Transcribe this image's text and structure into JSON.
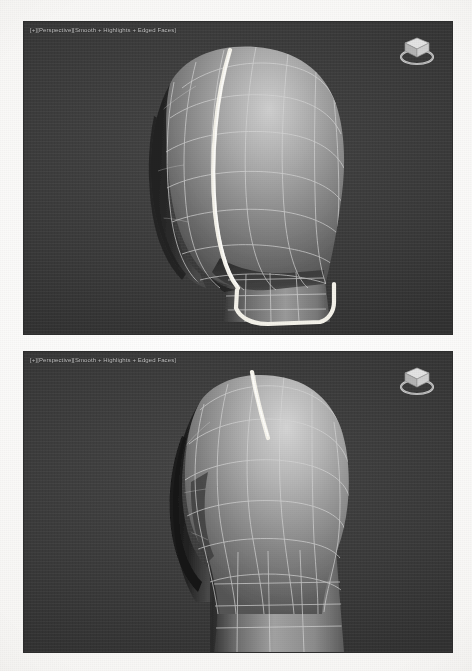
{
  "page": {
    "background_color": "#fdfdfc"
  },
  "viewports": [
    {
      "id": "viewport-top",
      "label": "[+][Perspective][Smooth + Highlights + Edged Faces]",
      "label_parts": {
        "menu": "[+]",
        "view": "[Perspective]",
        "shading": "[Smooth + Highlights + Edged Faces]"
      },
      "background_color": "#3d3d3d",
      "model": {
        "name": "head-mesh",
        "view_angle": "three-quarter front-left",
        "shading": "smooth-highlights",
        "wireframe_visible": true,
        "wireframe_color": "#d9d9d9",
        "selection": {
          "type": "edge-loop",
          "color": "#f2f0e8",
          "description": "Vertical edge loop down the side of the face and a loop around the jaw and chin"
        }
      },
      "viewcube": {
        "name": "view-cube",
        "face_label": "TOP",
        "compass_ring": true
      }
    },
    {
      "id": "viewport-bottom",
      "label": "[+][Perspective][Smooth + Highlights + Edged Faces]",
      "label_parts": {
        "menu": "[+]",
        "view": "[Perspective]",
        "shading": "[Smooth + Highlights + Edged Faces]"
      },
      "background_color": "#3d3d3d",
      "model": {
        "name": "head-mesh",
        "view_angle": "rear three-quarter, head and neck",
        "shading": "smooth-highlights",
        "wireframe_visible": true,
        "wireframe_color": "#d9d9d9",
        "selection": {
          "type": "edge-loop",
          "color": "#f2f0e8",
          "description": "Short highlighted edge segment across the top of the skull"
        }
      },
      "viewcube": {
        "name": "view-cube",
        "face_label": "TOP",
        "compass_ring": true
      }
    }
  ],
  "colors": {
    "viewport_background": "#3d3d3d",
    "wireframe": "#d9d9d9",
    "highlight_edge": "#f2f0e8",
    "label_text": "#c9c9c9",
    "page": "#fdfdfc"
  }
}
